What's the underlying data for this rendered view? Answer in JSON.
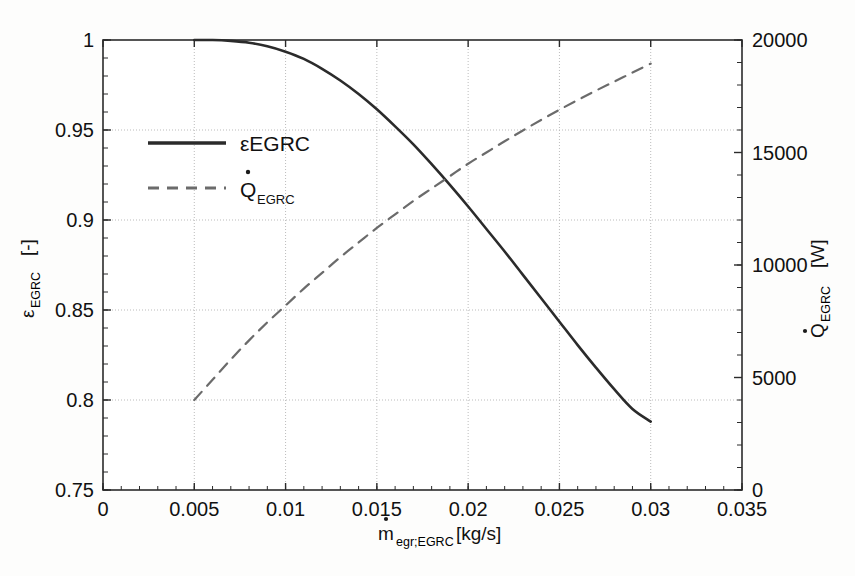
{
  "chart_data": {
    "type": "line",
    "title": "",
    "xlabel": "ṁegr;EGRC [kg/s]",
    "xlabel_main": "m",
    "xlabel_sub": "egr;EGRC",
    "xlabel_unit": "[kg/s]",
    "ylabel_left_main": "ε",
    "ylabel_left_sub": "EGRC",
    "ylabel_left_unit": "[-]",
    "ylabel_left": "εEGRC [-]",
    "ylabel_right_main": "Q",
    "ylabel_right_sub": "EGRC",
    "ylabel_right_unit": "[W]",
    "ylabel_right": "Q̇EGRC [W]",
    "xlim": [
      0,
      0.035
    ],
    "ylim_left": [
      0.75,
      1
    ],
    "ylim_right": [
      0,
      20000
    ],
    "xticks": [
      0,
      0.005,
      0.01,
      0.015,
      0.02,
      0.025,
      0.03,
      0.035
    ],
    "xticklabels": [
      "0",
      "0.005",
      "0.01",
      "0.015",
      "0.02",
      "0.025",
      "0.03",
      "0.035"
    ],
    "yticks_left": [
      0.75,
      0.8,
      0.85,
      0.9,
      0.95,
      1
    ],
    "yticklabels_left": [
      "0.75",
      "0.8",
      "0.85",
      "0.9",
      "0.95",
      "1"
    ],
    "yticks_right": [
      0,
      5000,
      10000,
      15000,
      20000
    ],
    "yticklabels_right": [
      "0",
      "5000",
      "10000",
      "15000",
      "20000"
    ],
    "ytick_minor_step_left": 0.01,
    "grid": true,
    "grid_color": "#b9b9b9",
    "legend_position": "upper-left-inside",
    "series": [
      {
        "name": "εEGRC",
        "legend_label_main": "ε",
        "legend_label_rest": "EGRC",
        "axis": "left",
        "style": "solid",
        "color": "#2b2b2b",
        "x": [
          0.005,
          0.006,
          0.007,
          0.008,
          0.009,
          0.01,
          0.011,
          0.012,
          0.013,
          0.014,
          0.015,
          0.016,
          0.017,
          0.018,
          0.019,
          0.02,
          0.021,
          0.022,
          0.023,
          0.024,
          0.025,
          0.026,
          0.027,
          0.028,
          0.029,
          0.03
        ],
        "y": [
          1.0,
          1.0,
          0.9995,
          0.9985,
          0.9965,
          0.9935,
          0.9895,
          0.984,
          0.9775,
          0.97,
          0.9615,
          0.952,
          0.942,
          0.931,
          0.9195,
          0.9075,
          0.895,
          0.8825,
          0.8695,
          0.8565,
          0.8435,
          0.8305,
          0.818,
          0.806,
          0.795,
          0.788
        ]
      },
      {
        "name": "Q̇EGRC",
        "legend_label_main": "Q",
        "legend_label_rest": "EGRC",
        "axis": "right",
        "style": "dashed",
        "color": "#6b6b6b",
        "x": [
          0.005,
          0.006,
          0.007,
          0.008,
          0.009,
          0.01,
          0.011,
          0.012,
          0.013,
          0.014,
          0.015,
          0.016,
          0.017,
          0.018,
          0.019,
          0.02,
          0.021,
          0.022,
          0.023,
          0.024,
          0.025,
          0.026,
          0.027,
          0.028,
          0.029,
          0.03
        ],
        "y": [
          4000,
          4900,
          5800,
          6650,
          7450,
          8200,
          8950,
          9650,
          10350,
          11000,
          11650,
          12250,
          12850,
          13400,
          13950,
          14500,
          15000,
          15500,
          15980,
          16450,
          16900,
          17330,
          17750,
          18150,
          18550,
          18950
        ]
      }
    ],
    "annotations": {
      "crossing_point": {
        "x": 0.0188,
        "y_left": 0.918,
        "y_right": 13850
      }
    }
  }
}
